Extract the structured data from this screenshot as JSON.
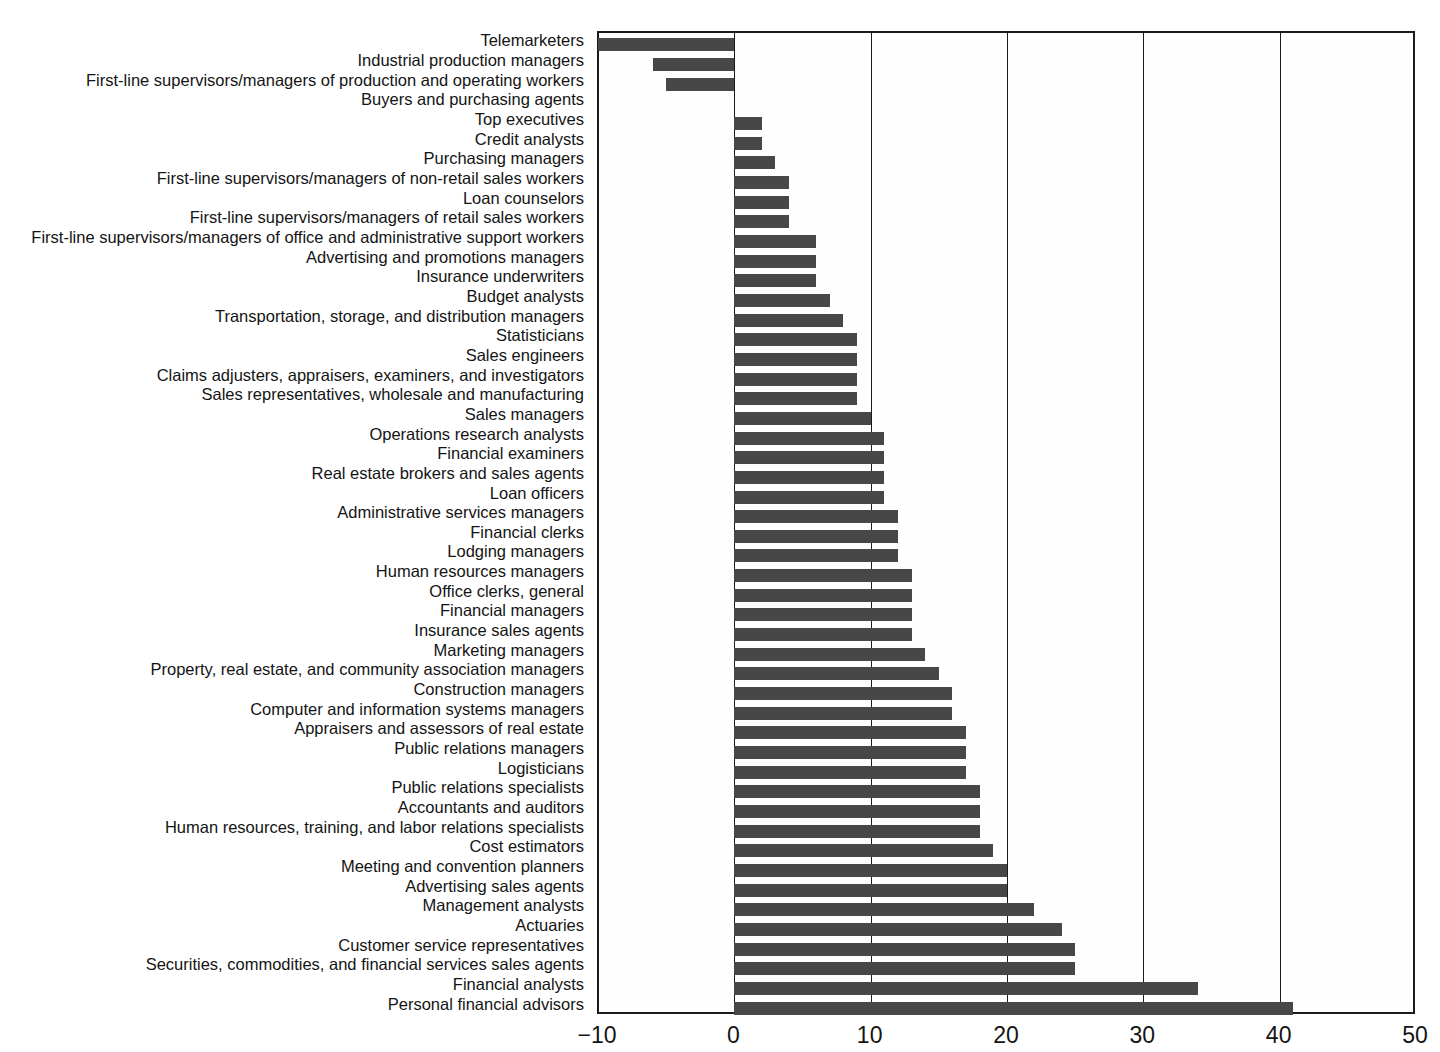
{
  "chart_data": {
    "type": "bar",
    "orientation": "horizontal",
    "title": "",
    "subtitle": "",
    "xlabel": "",
    "ylabel": "",
    "xlim": [
      -10,
      50
    ],
    "xticks": [
      -10,
      0,
      10,
      20,
      30,
      40,
      50
    ],
    "xtick_labels": [
      "−10",
      "0",
      "10",
      "20",
      "30",
      "40",
      "50"
    ],
    "grid": "vertical gridlines at each x tick",
    "legend": "none",
    "bar_color": "#474747",
    "frame_color": "#1b1b1b",
    "background": "#ffffff",
    "categories": [
      "Telemarketers",
      "Industrial production managers",
      "First-line supervisors/managers of production and operating workers",
      "Buyers and purchasing agents",
      "Top executives",
      "Credit analysts",
      "Purchasing managers",
      "First-line supervisors/managers of non-retail sales workers",
      "Loan counselors",
      "First-line supervisors/managers of retail sales workers",
      "First-line supervisors/managers of office and administrative support workers",
      "Advertising and promotions managers",
      "Insurance underwriters",
      "Budget analysts",
      "Transportation, storage, and distribution managers",
      "Statisticians",
      "Sales engineers",
      "Claims adjusters, appraisers, examiners, and investigators",
      "Sales representatives, wholesale and manufacturing",
      "Sales managers",
      "Operations research analysts",
      "Financial examiners",
      "Real estate brokers and sales agents",
      "Loan officers",
      "Administrative services managers",
      "Financial clerks",
      "Lodging managers",
      "Human resources managers",
      "Office clerks, general",
      "Financial managers",
      "Insurance sales agents",
      "Marketing managers",
      "Property, real estate, and community association managers",
      "Construction managers",
      "Computer and information systems managers",
      "Appraisers and assessors of real estate",
      "Public relations managers",
      "Logisticians",
      "Public relations specialists",
      "Accountants and auditors",
      "Human resources, training, and labor relations specialists",
      "Cost estimators",
      "Meeting and convention planners",
      "Advertising sales agents",
      "Management analysts",
      "Actuaries",
      "Customer service representatives",
      "Securities, commodities, and financial services sales agents",
      "Financial analysts",
      "Personal financial advisors"
    ],
    "values": [
      -10.0,
      -6.0,
      -5.0,
      0.0,
      2.0,
      2.0,
      3.0,
      4.0,
      4.0,
      4.0,
      6.0,
      6.0,
      6.0,
      7.0,
      8.0,
      9.0,
      9.0,
      9.0,
      9.0,
      10.0,
      11.0,
      11.0,
      11.0,
      11.0,
      12.0,
      12.0,
      12.0,
      13.0,
      13.0,
      13.0,
      13.0,
      14.0,
      15.0,
      16.0,
      16.0,
      17.0,
      17.0,
      17.0,
      18.0,
      18.0,
      18.0,
      19.0,
      20.0,
      20.0,
      22.0,
      24.0,
      25.0,
      25.0,
      34.0,
      41.0
    ]
  }
}
